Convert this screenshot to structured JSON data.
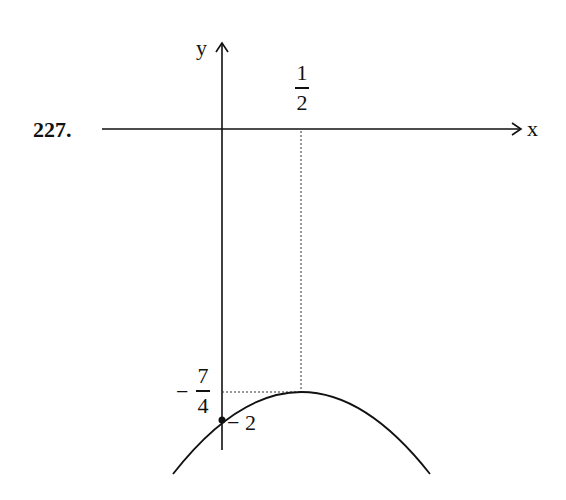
{
  "problem_number": "227.",
  "axes": {
    "x_label": "x",
    "y_label": "y"
  },
  "labels": {
    "vertex_x": {
      "numerator": "1",
      "denominator": "2"
    },
    "vertex_y": {
      "sign": "−",
      "numerator": "7",
      "denominator": "4"
    },
    "y_intercept": "− 2"
  },
  "graph": {
    "type": "parabola",
    "opens": "down",
    "vertex": [
      0.5,
      -1.75
    ],
    "y_intercept": [
      0,
      -2
    ],
    "equation": "y = -x^2 + x - 2"
  }
}
